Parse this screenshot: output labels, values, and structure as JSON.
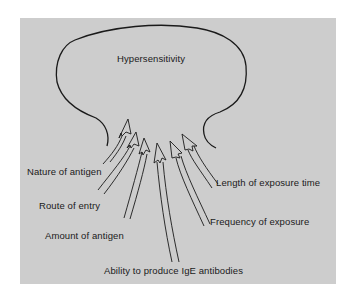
{
  "diagram": {
    "title": "Hypersensitivity",
    "center_node": {
      "label": "Hypersensitivity",
      "shape": "rounded-blob"
    },
    "factors": [
      {
        "id": "nature",
        "label": "Nature of antigen",
        "side": "left"
      },
      {
        "id": "route",
        "label": "Route of entry",
        "side": "left"
      },
      {
        "id": "amount",
        "label": "Amount of antigen",
        "side": "left"
      },
      {
        "id": "ige",
        "label": "Ability to produce IgE antibodies",
        "side": "bottom"
      },
      {
        "id": "frequency",
        "label": "Frequency of exposure",
        "side": "right"
      },
      {
        "id": "length",
        "label": "Length of exposure time",
        "side": "right"
      }
    ],
    "edges": [
      {
        "from": "nature",
        "to": "Hypersensitivity"
      },
      {
        "from": "route",
        "to": "Hypersensitivity"
      },
      {
        "from": "amount",
        "to": "Hypersensitivity"
      },
      {
        "from": "ige",
        "to": "Hypersensitivity"
      },
      {
        "from": "frequency",
        "to": "Hypersensitivity"
      },
      {
        "from": "length",
        "to": "Hypersensitivity"
      }
    ],
    "colors": {
      "panel_background": "#cdcdcd",
      "stroke": "#1a1a1a",
      "page_background": "#ffffff"
    }
  }
}
